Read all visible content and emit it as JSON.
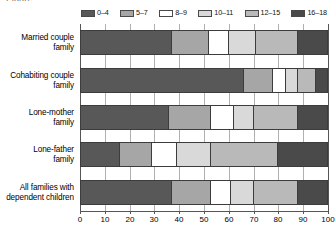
{
  "clipped_header_text": "Figure",
  "legend": {
    "position": "top",
    "items": [
      {
        "label": "0–4",
        "color": "#585858"
      },
      {
        "label": "5–7",
        "color": "#a6a6a6"
      },
      {
        "label": "8–9",
        "color": "#ffffff"
      },
      {
        "label": "10–11",
        "color": "#d9d9d9"
      },
      {
        "label": "12–15",
        "color": "#b9b9b9"
      },
      {
        "label": "16–18",
        "color": "#4a4a4a"
      }
    ]
  },
  "chart_data": {
    "type": "bar",
    "orientation": "horizontal",
    "stacked": true,
    "stack_mode": "percent",
    "title": "",
    "subtitle": "",
    "xlabel": "",
    "ylabel": "",
    "xlim": [
      0,
      100
    ],
    "xticks": [
      0,
      10,
      20,
      30,
      40,
      50,
      60,
      70,
      80,
      90,
      100
    ],
    "xtick_labels": [
      "0",
      "10",
      "20",
      "30",
      "40",
      "50",
      "60",
      "70",
      "80",
      "90",
      "100"
    ],
    "grid": true,
    "legend_position": "top",
    "categories": [
      "Married couple family",
      "Cohabiting couple family",
      "Lone-mother family",
      "Lone-father family",
      "All families with dependent children"
    ],
    "category_lines": [
      [
        "Married couple",
        "family"
      ],
      [
        "Cohabiting couple",
        "family"
      ],
      [
        "Lone-mother",
        "family"
      ],
      [
        "Lone-father",
        "family"
      ],
      [
        "All families with",
        "dependent children"
      ]
    ],
    "series": [
      {
        "name": "0–4",
        "color": "#585858",
        "values": [
          37,
          66,
          36,
          16,
          37
        ]
      },
      {
        "name": "5–7",
        "color": "#a6a6a6",
        "values": [
          15,
          12,
          17,
          13,
          16
        ]
      },
      {
        "name": "8–9",
        "color": "#ffffff",
        "values": [
          8,
          5,
          9,
          10,
          8
        ]
      },
      {
        "name": "10–11",
        "color": "#d9d9d9",
        "values": [
          11,
          5,
          8,
          14,
          9
        ]
      },
      {
        "name": "12–15",
        "color": "#b9b9b9",
        "values": [
          17,
          7,
          18,
          27,
          18
        ]
      },
      {
        "name": "16–18",
        "color": "#4a4a4a",
        "values": [
          12,
          5,
          12,
          20,
          12
        ]
      }
    ]
  }
}
